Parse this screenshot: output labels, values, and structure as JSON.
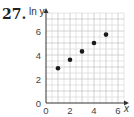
{
  "problem_number": "27.",
  "chart_data": {
    "type": "scatter",
    "title": "",
    "xlabel": "x",
    "ylabel": "ln y",
    "x": [
      1,
      2,
      3,
      4,
      5
    ],
    "y": [
      2.9,
      3.6,
      4.3,
      5.0,
      5.7
    ],
    "xlim": [
      0,
      6.5
    ],
    "ylim": [
      0,
      7.5
    ],
    "x_ticks": [
      "0",
      "2",
      "4",
      "6"
    ],
    "y_ticks": [
      "0",
      "2",
      "4",
      "6"
    ],
    "grid": true,
    "grid_step": 1,
    "point_color": "#1a1a1a",
    "grid_color": "#c8c8c8"
  }
}
